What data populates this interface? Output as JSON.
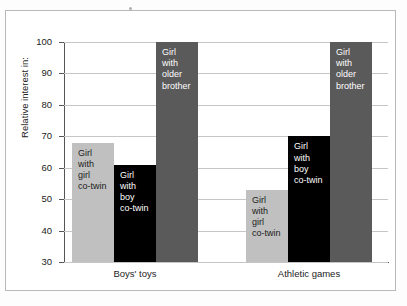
{
  "chart_data": {
    "type": "bar",
    "title": "",
    "xlabel": "",
    "ylabel": "Relative interest in:",
    "categories": [
      "Boys' toys",
      "Athletic games"
    ],
    "ylim": [
      30,
      100
    ],
    "yticks": [
      30,
      40,
      50,
      60,
      70,
      80,
      90,
      100
    ],
    "ytick_labels": [
      "30",
      "40",
      "50",
      "60",
      "70",
      "80",
      "90",
      "100"
    ],
    "grid": true,
    "legend": "none (bars labelled in place)",
    "series": [
      {
        "name": "Girl with girl co-twin",
        "label": "Girl\nwith\ngirl\nco-twin",
        "color": "#c0c0c0",
        "values": [
          68,
          53
        ]
      },
      {
        "name": "Girl with boy co-twin",
        "label": "Girl\nwith\nboy\nco-twin",
        "color": "#000000",
        "values": [
          61,
          70
        ]
      },
      {
        "name": "Girl with older brother",
        "label": "Girl\nwith\nolder\nbrother",
        "color": "#5a5a5a",
        "values": [
          100,
          100
        ]
      }
    ]
  },
  "colors": {
    "light_gray_bar": "#c0c0c0",
    "black_bar": "#000000",
    "dark_gray_bar": "#5a5a5a",
    "gridline": "#c6c6c6",
    "axis": "#555555",
    "frame": "#b9b9b9",
    "background": "#ffffff"
  }
}
